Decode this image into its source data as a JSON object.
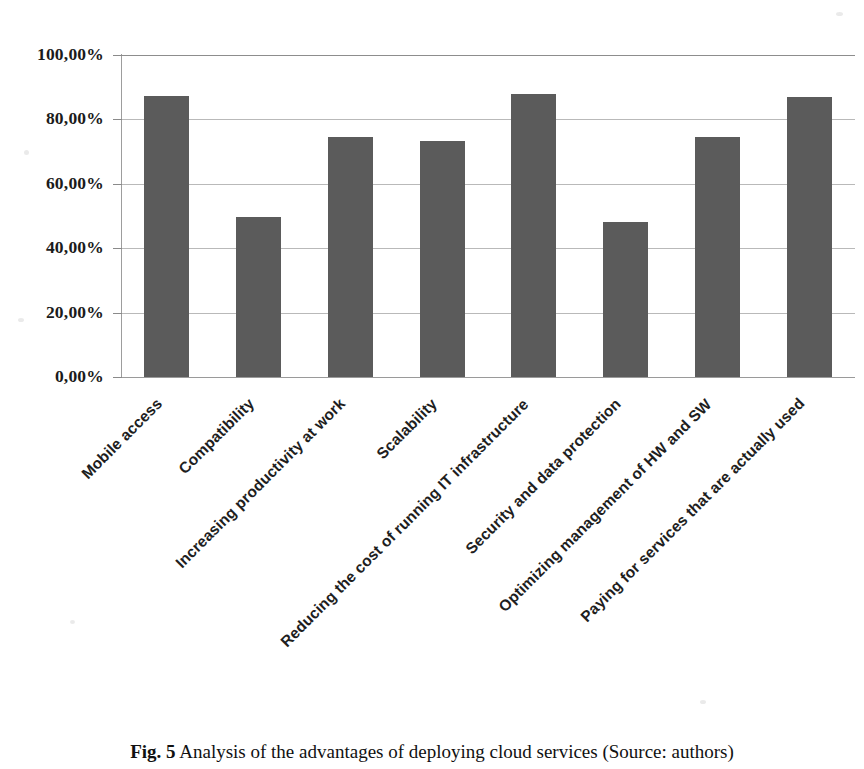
{
  "figure": {
    "caption_number": "Fig. 5",
    "caption_text": "Analysis of the advantages of deploying cloud services (Source: authors)"
  },
  "chart_data": {
    "type": "bar",
    "title": "",
    "subtitle": "",
    "xlabel": "",
    "ylabel": "",
    "ylim": [
      0,
      100
    ],
    "grid": true,
    "legend": "none",
    "orientation": "vertical",
    "bar_color": "#5b5b5b",
    "value_suffix": "%",
    "decimal_separator": ",",
    "categories": [
      "Mobile access",
      "Compatibility",
      "Increasing productivity at work",
      "Scalability",
      "Reducing the cost of running IT infrastructure",
      "Security and data protection",
      "Optimizing management of HW and SW",
      "Paying for services that are actually used"
    ],
    "values": [
      87.3,
      49.7,
      74.4,
      73.2,
      88.0,
      48.2,
      74.6,
      87.1
    ],
    "ytick_values": [
      100,
      80,
      60,
      40,
      20,
      0
    ],
    "ytick_labels": [
      "100,00%",
      "80,00%",
      "60,00%",
      "40,00%",
      "20,00%",
      "0,00%"
    ]
  }
}
